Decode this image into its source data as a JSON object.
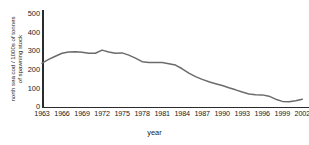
{
  "chart_data": {
    "type": "line",
    "title": "",
    "xlabel": "year",
    "ylabel": "north sea cod / 1000s of tonnes of spawning stock",
    "ylabel_lines": [
      "north sea cod / 1000s of tonnes",
      "of spawning stock"
    ],
    "xlim": [
      1963,
      2003
    ],
    "ylim": [
      0,
      520
    ],
    "yticks": [
      0,
      100,
      200,
      300,
      400,
      500
    ],
    "ytick_labels": [
      "0",
      "100",
      "200",
      "300",
      "400",
      "500"
    ],
    "xticks": [
      1963,
      1966,
      1969,
      1972,
      1975,
      1978,
      1981,
      1984,
      1987,
      1990,
      1993,
      1996,
      1999,
      2002
    ],
    "xtick_labels": [
      "1963",
      "1966",
      "1969",
      "1972",
      "1975",
      "1978",
      "1981",
      "1984",
      "1987",
      "1990",
      "1993",
      "1996",
      "1999",
      "2002"
    ],
    "grid": false,
    "legend": false,
    "line_color": "#6b6b6b",
    "axis_color": "#2b2b2b",
    "series": [
      {
        "name": "north sea cod spawning stock",
        "x": [
          1963,
          1964,
          1965,
          1966,
          1967,
          1968,
          1969,
          1970,
          1971,
          1972,
          1973,
          1974,
          1975,
          1976,
          1977,
          1978,
          1979,
          1980,
          1981,
          1982,
          1983,
          1984,
          1985,
          1986,
          1987,
          1988,
          1989,
          1990,
          1991,
          1992,
          1993,
          1994,
          1995,
          1996,
          1997,
          1998,
          1999,
          2000,
          2001,
          2002
        ],
        "values": [
          235,
          255,
          272,
          288,
          295,
          296,
          293,
          288,
          288,
          305,
          295,
          288,
          290,
          278,
          262,
          243,
          238,
          238,
          238,
          232,
          225,
          205,
          182,
          163,
          148,
          135,
          125,
          115,
          103,
          92,
          80,
          70,
          66,
          65,
          58,
          42,
          30,
          28,
          33,
          42
        ]
      }
    ]
  }
}
